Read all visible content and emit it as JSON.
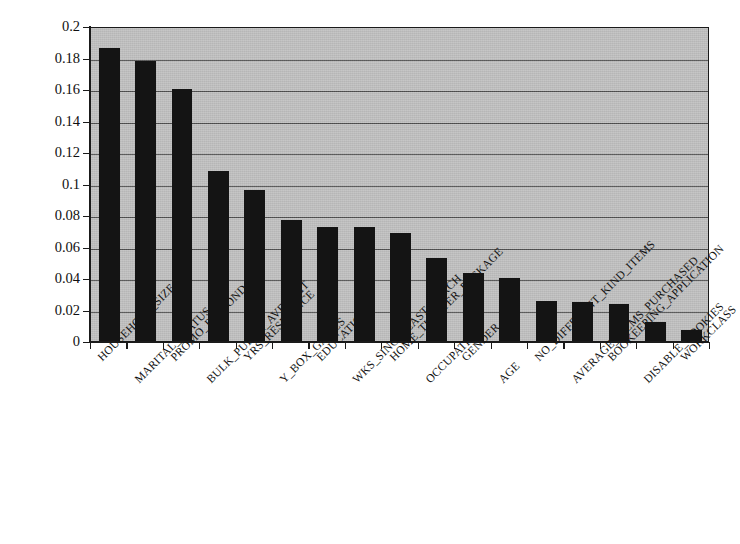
{
  "chart_data": {
    "type": "bar",
    "title": "",
    "subtitle": "",
    "xlabel": "",
    "ylabel": "",
    "ylim": [
      0,
      0.2
    ],
    "grid": true,
    "legend": null,
    "legend_position": "none",
    "orientation": "vertical",
    "bar_color": "#141414",
    "plot_background": "#bfbfbf",
    "page_background": "#ffffff",
    "ytick_labels": [
      "0.2",
      "0.18",
      "0.16",
      "0.14",
      "0.12",
      "0.1",
      "0.08",
      "0.06",
      "0.04",
      "0.02",
      "0"
    ],
    "ytick_values": [
      0.2,
      0.18,
      0.16,
      0.14,
      0.12,
      0.1,
      0.08,
      0.06,
      0.04,
      0.02,
      0
    ],
    "xtick_label_rotation": -45,
    "categories": [
      "HOUSEHOLD_SIZE",
      "MARITAL_STATUS",
      "PROMO_RESPOND",
      "BULK_PURCH_AVE_AMT",
      "YRS_RESIDENCE",
      "Y_BOX_GAMES",
      "EDUCATION",
      "WKS_SINCE_LAST_PURCH",
      "HOME_THEATER_PACKAGE",
      "OCCUPATION",
      "GENDER",
      "AGE",
      "NO_DIFFERENT_KIND_ITEMS",
      "AVERAGE_ITEMS_PURCHASED",
      "BOOKEEPING_APPLICATION",
      "DISABLE_COOKIES",
      "WORKCLASS"
    ],
    "values": [
      0.186,
      0.178,
      0.16,
      0.108,
      0.096,
      0.077,
      0.0722,
      0.0722,
      0.0688,
      0.053,
      0.043,
      0.04,
      0.0253,
      0.0247,
      0.0237,
      0.012,
      0.0072
    ]
  }
}
